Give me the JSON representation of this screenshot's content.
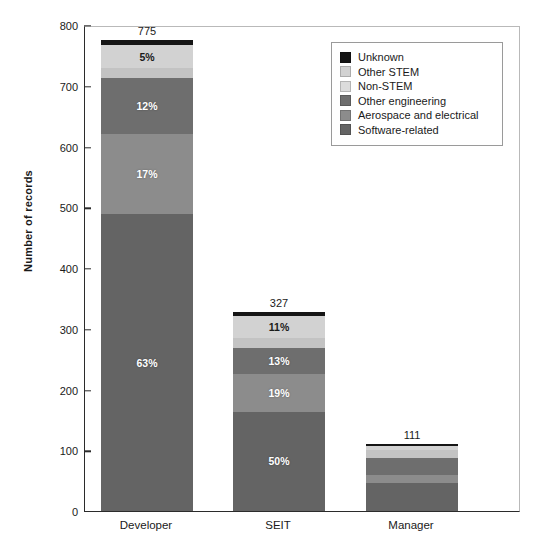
{
  "chart_data": {
    "type": "bar",
    "subtype": "stacked-bar",
    "title": "",
    "xlabel": "",
    "ylabel": "Number of records",
    "ylim": [
      0,
      800
    ],
    "ytick_values": [
      0,
      100,
      200,
      300,
      400,
      500,
      600,
      700,
      800
    ],
    "ytick_labels": [
      "0",
      "100",
      "200",
      "300",
      "400",
      "500",
      "600",
      "700",
      "800"
    ],
    "grid": false,
    "legend_position": "top-right",
    "categories": [
      "Developer",
      "SEIT",
      "Manager"
    ],
    "category_totals": [
      775,
      327,
      111
    ],
    "category_total_labels": [
      "775",
      "327",
      "111"
    ],
    "stack_order_bottom_to_top": [
      "Software-related",
      "Aerospace and electrical",
      "Other engineering",
      "Non-STEM",
      "Other STEM",
      "Unknown"
    ],
    "series": [
      {
        "name": "Software-related",
        "color": "#646464",
        "percent": [
          63,
          50,
          42
        ],
        "percent_labels": [
          "63%",
          "50%",
          ""
        ],
        "values": [
          488,
          164,
          47
        ]
      },
      {
        "name": "Aerospace and electrical",
        "color": "#8c8c8c",
        "percent": [
          17,
          19,
          12
        ],
        "percent_labels": [
          "17%",
          "19%",
          ""
        ],
        "values": [
          132,
          62,
          13
        ]
      },
      {
        "name": "Other engineering",
        "color": "#6e6e6e",
        "percent": [
          12,
          13,
          25
        ],
        "percent_labels": [
          "12%",
          "13%",
          ""
        ],
        "values": [
          93,
          43,
          28
        ]
      },
      {
        "name": "Non-STEM",
        "color": "#c3c3c3",
        "percent": [
          2,
          5,
          11
        ],
        "percent_labels": [
          "",
          "",
          ""
        ],
        "values": [
          16,
          16,
          12
        ]
      },
      {
        "name": "Other STEM",
        "color": "#d2d2d2",
        "percent": [
          5,
          11,
          7
        ],
        "percent_labels": [
          "5%",
          "11%",
          ""
        ],
        "values": [
          39,
          36,
          8
        ]
      },
      {
        "name": "Unknown",
        "color": "#151515",
        "percent": [
          1,
          2,
          3
        ],
        "percent_labels": [
          "",
          "",
          ""
        ],
        "values": [
          7,
          6,
          3
        ]
      }
    ]
  },
  "legend": {
    "items": [
      {
        "label": "Unknown",
        "color": "#151515"
      },
      {
        "label": "Other STEM",
        "color": "#d2d2d2"
      },
      {
        "label": "Non-STEM",
        "color": "#dcdcdc"
      },
      {
        "label": "Other engineering",
        "color": "#6e6e6e"
      },
      {
        "label": "Aerospace and electrical",
        "color": "#8c8c8c"
      },
      {
        "label": "Software-related",
        "color": "#646464"
      }
    ]
  },
  "axis": {
    "y_title": "Number of records",
    "y_ticks": [
      "800",
      "700",
      "600",
      "500",
      "400",
      "300",
      "200",
      "100",
      "0"
    ],
    "x_ticks": [
      "Developer",
      "SEIT",
      "Manager"
    ]
  },
  "colors": {
    "axis": "#2b2b2b",
    "frame_light": "#b9b9b9",
    "text": "#1a1a1a",
    "background": "#ffffff"
  }
}
